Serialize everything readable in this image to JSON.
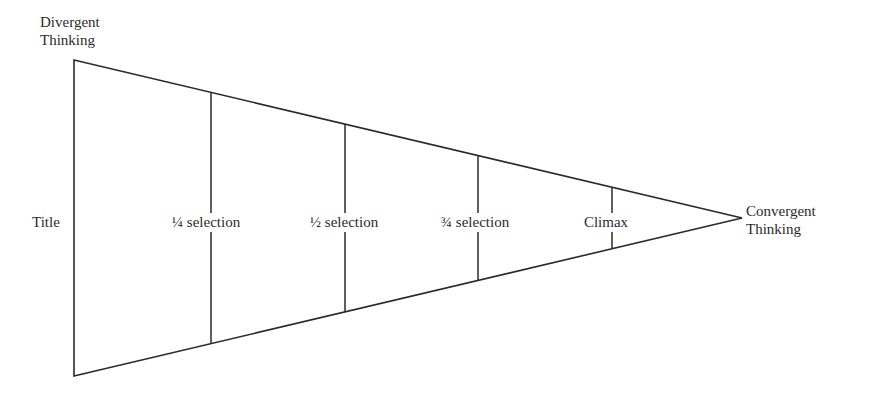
{
  "diagram": {
    "type": "funnel-triangle",
    "stroke_color": "#2a2a2a",
    "background": "#ffffff",
    "start_label": {
      "line1": "Divergent",
      "line2": "Thinking"
    },
    "end_label": {
      "line1": "Convergent",
      "line2": "Thinking"
    },
    "stages": [
      {
        "label": "Title"
      },
      {
        "label": "¼ selection"
      },
      {
        "label": "½ selection"
      },
      {
        "label": "¾ selection"
      },
      {
        "label": "Climax"
      }
    ]
  }
}
